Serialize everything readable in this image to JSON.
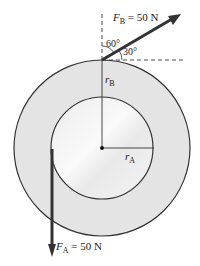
{
  "diagram": {
    "force_b": {
      "symbol": "F",
      "subscript": "B",
      "value": " = 50 N"
    },
    "force_a": {
      "symbol": "F",
      "subscript": "A",
      "value": " = 50 N"
    },
    "angle_vertical": "60°",
    "angle_horizontal": "30°",
    "radius_b": {
      "symbol": "r",
      "subscript": "B"
    },
    "radius_a": {
      "symbol": "r",
      "subscript": "A"
    },
    "colors": {
      "disk_outer": "#e6e6e6",
      "disk_inner": "#f4f4f4",
      "stroke": "#333333"
    }
  }
}
